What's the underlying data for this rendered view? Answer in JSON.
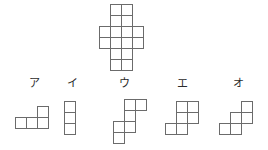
{
  "figure": {
    "type": "net-folding-puzzle",
    "cell_size": 11,
    "stroke_color": "#6b6b6b",
    "fill_color": "#ffffff",
    "background_color": "#ffffff",
    "prompt_shape": {
      "name": "plus-cross-net",
      "cell_count": 12,
      "grid_columns": 4,
      "grid_rows": 6,
      "cells": [
        [
          1,
          0
        ],
        [
          2,
          0
        ],
        [
          1,
          1
        ],
        [
          2,
          1
        ],
        [
          0,
          2
        ],
        [
          1,
          2
        ],
        [
          2,
          2
        ],
        [
          3,
          2
        ],
        [
          0,
          3
        ],
        [
          1,
          3
        ],
        [
          2,
          3
        ],
        [
          3,
          3
        ],
        [
          1,
          4
        ],
        [
          2,
          4
        ],
        [
          1,
          5
        ],
        [
          2,
          5
        ]
      ],
      "position": {
        "x": 98,
        "y": 3
      }
    },
    "options": [
      {
        "id": "a",
        "label": "ア",
        "label_position": {
          "x": 24,
          "y": 78
        },
        "shape_position": {
          "x": 14,
          "y": 105
        },
        "grid_columns": 3,
        "grid_rows": 2,
        "cell_count": 4,
        "cells": [
          [
            2,
            0
          ],
          [
            0,
            1
          ],
          [
            1,
            1
          ],
          [
            2,
            1
          ]
        ]
      },
      {
        "id": "b",
        "label": "イ",
        "label_position": {
          "x": 62,
          "y": 78
        },
        "shape_position": {
          "x": 63,
          "y": 100
        },
        "grid_columns": 1,
        "grid_rows": 3,
        "cell_count": 3,
        "cells": [
          [
            0,
            0
          ],
          [
            0,
            1
          ],
          [
            0,
            2
          ]
        ]
      },
      {
        "id": "c",
        "label": "ウ",
        "label_position": {
          "x": 114,
          "y": 78
        },
        "shape_position": {
          "x": 101,
          "y": 98
        },
        "grid_columns": 4,
        "grid_rows": 4,
        "cell_count": 6,
        "cells": [
          [
            2,
            0
          ],
          [
            3,
            0
          ],
          [
            2,
            1
          ],
          [
            1,
            2
          ],
          [
            2,
            2
          ],
          [
            1,
            3
          ]
        ]
      },
      {
        "id": "d",
        "label": "エ",
        "label_position": {
          "x": 172,
          "y": 78
        },
        "shape_position": {
          "x": 164,
          "y": 100
        },
        "grid_columns": 3,
        "grid_rows": 3,
        "cell_count": 5,
        "cells": [
          [
            1,
            0
          ],
          [
            2,
            0
          ],
          [
            1,
            1
          ],
          [
            2,
            1
          ],
          [
            0,
            2
          ],
          [
            1,
            2
          ]
        ]
      },
      {
        "id": "e",
        "label": "オ",
        "label_position": {
          "x": 228,
          "y": 78
        },
        "shape_position": {
          "x": 218,
          "y": 100
        },
        "grid_columns": 3,
        "grid_rows": 3,
        "cell_count": 4,
        "cells": [
          [
            2,
            0
          ],
          [
            1,
            1
          ],
          [
            2,
            1
          ],
          [
            1,
            2
          ],
          [
            0,
            2
          ]
        ]
      }
    ]
  }
}
